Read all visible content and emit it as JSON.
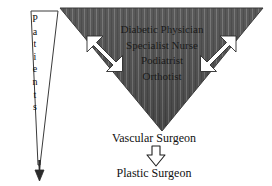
{
  "diagram": {
    "background_color": "#ffffff",
    "triangle_fill_color": "#4d4d4d",
    "triangle_stripe_color": "#6b6b6b",
    "arrow_fill_color": "#ffffff",
    "arrow_outline_color": "#1a1a1a",
    "text_color": "#111111"
  },
  "patients_funnel": {
    "label": "Patients",
    "letters": [
      "P",
      "a",
      "t",
      "i",
      "e",
      "n",
      "t",
      "s"
    ],
    "shape": "downward-narrowing-triangle-outline",
    "arrow_direction": "down"
  },
  "team_triangle": {
    "shape": "inverted-triangle",
    "members": [
      "Diabetic Physician",
      "Specialist Nurse",
      "Podiatrist",
      "Orthotist"
    ],
    "arrows": [
      {
        "name": "left-double-arrow",
        "direction": "bidirectional-diagonal"
      },
      {
        "name": "right-double-arrow",
        "direction": "bidirectional-diagonal"
      }
    ]
  },
  "referral_chain": {
    "steps": [
      "Vascular Surgeon",
      "Plastic Surgeon"
    ],
    "connector": {
      "name": "down-block-arrow",
      "direction": "down"
    }
  }
}
